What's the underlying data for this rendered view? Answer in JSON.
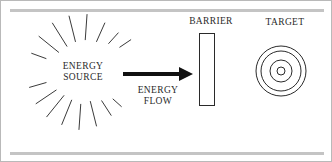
{
  "figure": {
    "type": "schematic-diagram",
    "title_text": "",
    "background_color": "#ffffff",
    "frame_border_color": "#b9b9b9",
    "rule_color": "#c4c4c4",
    "ink_color": "#2a2a2a",
    "arrow_color": "#111111",
    "rules": [
      {
        "name": "top-rule",
        "x1": 9,
        "y1": 9,
        "x2": 323,
        "y2": 9,
        "width": 3
      },
      {
        "name": "bottom-rule",
        "x1": 9,
        "y1": 152,
        "x2": 323,
        "y2": 152,
        "width": 3
      }
    ],
    "labels": {
      "energy_source": "ENERGY\nSOURCE",
      "energy_flow": "ENERGY\nFLOW",
      "barrier": "BARRIER",
      "target": "TARGET"
    },
    "energy_source": {
      "center_x": 82,
      "center_y": 71,
      "ray_count": 16,
      "ray_inner_radius": 26,
      "ray_outer_radius": 57,
      "ray_stroke_width": 1,
      "rays": [
        {
          "angle_deg": 248,
          "inner": 30,
          "outer": 57
        },
        {
          "angle_deg": 266,
          "inner": 32,
          "outer": 58
        },
        {
          "angle_deg": 284,
          "inner": 30,
          "outer": 56
        },
        {
          "angle_deg": 303,
          "inner": 34,
          "outer": 52
        },
        {
          "angle_deg": 318,
          "inner": 40,
          "outer": 52
        },
        {
          "angle_deg": 196,
          "inner": 38,
          "outer": 56
        },
        {
          "angle_deg": 214,
          "inner": 32,
          "outer": 57
        },
        {
          "angle_deg": 231,
          "inner": 30,
          "outer": 58
        },
        {
          "angle_deg": 160,
          "inner": 39,
          "outer": 55
        },
        {
          "angle_deg": 141,
          "inner": 31,
          "outer": 57
        },
        {
          "angle_deg": 122,
          "inner": 30,
          "outer": 58
        },
        {
          "angle_deg": 104,
          "inner": 31,
          "outer": 58
        },
        {
          "angle_deg": 86,
          "inner": 32,
          "outer": 58
        },
        {
          "angle_deg": 66,
          "inner": 33,
          "outer": 54
        },
        {
          "angle_deg": 48,
          "inner": 38,
          "outer": 53
        },
        {
          "angle_deg": 34,
          "inner": 44,
          "outer": 58
        }
      ]
    },
    "energy_flow_arrow": {
      "x_start": 122,
      "x_end": 192,
      "y": 73,
      "shaft_thickness": 4,
      "head_length": 14,
      "head_half_height": 7
    },
    "barrier": {
      "x": 198,
      "y": 32,
      "width": 15,
      "height": 72,
      "fill": "#ffffff",
      "stroke": "#2a2a2a",
      "stroke_width": 1
    },
    "target": {
      "center_x": 280,
      "center_y": 70,
      "stroke": "#2a2a2a",
      "stroke_width": 1,
      "ring_radii": [
        25,
        20,
        11,
        4
      ]
    }
  }
}
